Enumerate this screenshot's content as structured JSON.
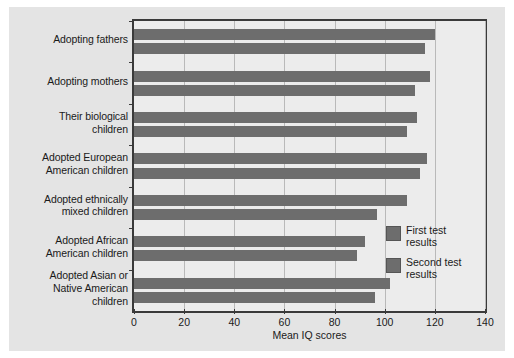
{
  "chart_data": {
    "type": "bar",
    "orientation": "horizontal",
    "title": "",
    "xlabel": "Mean IQ scores",
    "ylabel": "",
    "xlim": [
      0,
      140
    ],
    "xticks": [
      0,
      20,
      40,
      60,
      80,
      100,
      120,
      140
    ],
    "xticklabels": [
      "0",
      "20",
      "40",
      "60",
      "80",
      "100",
      "120",
      "140"
    ],
    "grid": true,
    "grid_axis": "x",
    "legend_position": "inside-right",
    "bar_color": "#6d6d6d",
    "categories": [
      "Adopting fathers",
      "Adopting mothers",
      "Their biological children",
      "Adopted European American children",
      "Adopted ethnically mixed children",
      "Adopted African American children",
      "Adopted Asian or Native American children"
    ],
    "category_lines": [
      [
        "Adopting fathers"
      ],
      [
        "Adopting mothers"
      ],
      [
        "Their biological",
        "children"
      ],
      [
        "Adopted European",
        "American children"
      ],
      [
        "Adopted ethnically",
        "mixed children"
      ],
      [
        "Adopted African",
        "American children"
      ],
      [
        "Adopted Asian or",
        "Native American",
        "children"
      ]
    ],
    "series": [
      {
        "name": "First test results",
        "name_lines": [
          "First test",
          "results"
        ],
        "values": [
          120,
          118,
          113,
          117,
          109,
          92,
          102
        ]
      },
      {
        "name": "Second test results",
        "name_lines": [
          "Second test",
          "results"
        ],
        "values": [
          116,
          112,
          109,
          114,
          97,
          89,
          96
        ]
      }
    ]
  },
  "legend": {
    "items": [
      {
        "label": "First test results",
        "color": "#6d6d6d"
      },
      {
        "label": "Second test results",
        "color": "#6d6d6d"
      }
    ]
  }
}
